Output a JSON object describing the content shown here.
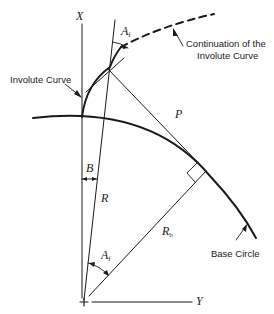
{
  "diagram": {
    "type": "involute gear geometry",
    "axes": {
      "x_label": "X",
      "y_label": "Y"
    },
    "labels": {
      "involute_curve": "Involute Curve",
      "continuation_line1": "Continuation of the",
      "continuation_line2": "Involute Curve",
      "base_circle": "Base Circle",
      "P": "P",
      "R": "R",
      "B": "B",
      "Rb_main": "R",
      "Rb_sub": "b",
      "Af_top_main": "A",
      "Af_top_sub": "f",
      "Af_bottom_main": "A",
      "Af_bottom_sub": "f"
    },
    "colors": {
      "stroke": "#1a1a1a",
      "background": "#ffffff"
    }
  }
}
